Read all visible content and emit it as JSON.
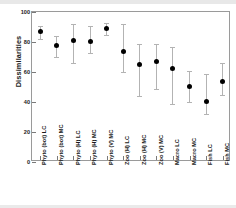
{
  "chart_data": {
    "type": "scatter",
    "title": "",
    "xlabel": "",
    "ylabel": "Dissimilarities",
    "ylim": [
      0,
      100
    ],
    "yticks": [
      0,
      20,
      40,
      60,
      80,
      100
    ],
    "ytick_labels": [
      "0",
      "20",
      "40",
      "60",
      "80",
      "100"
    ],
    "grid": false,
    "legend": "none",
    "error_bars": "vertical, capped",
    "marker_color": "#000000",
    "errorbar_color": "#b3b3b3",
    "categories": [
      "Phyto (bot) LC",
      "Phyto (bot) MC",
      "Phyto (H) LC",
      "Phyto (H) MC",
      "Phyto (V) MC",
      "Zoo (H) LC",
      "Zoo (H) MC",
      "Zoo (V) MC",
      "Macro LC",
      "Macro MC",
      "Fish LC",
      "Fish MC"
    ],
    "values": [
      87,
      78,
      81,
      80.5,
      89,
      74,
      65,
      67,
      62.5,
      50.5,
      40.5,
      54
    ],
    "lower": [
      82,
      70,
      66,
      73,
      85,
      60,
      44,
      49,
      38.5,
      40,
      32,
      44.5
    ],
    "upper": [
      91,
      84,
      92,
      91,
      93,
      92,
      79,
      79,
      77,
      61,
      59,
      66
    ],
    "points": [
      {
        "category": "Phyto (bot) LC",
        "value": 87,
        "lower": 82,
        "upper": 91
      },
      {
        "category": "Phyto (bot) MC",
        "value": 78,
        "lower": 70,
        "upper": 84
      },
      {
        "category": "Phyto (H) LC",
        "value": 81,
        "lower": 66,
        "upper": 92
      },
      {
        "category": "Phyto (H) MC",
        "value": 80.5,
        "lower": 73,
        "upper": 91
      },
      {
        "category": "Phyto (V) MC",
        "value": 89,
        "lower": 85,
        "upper": 93
      },
      {
        "category": "Zoo (H) LC",
        "value": 74,
        "lower": 60,
        "upper": 92
      },
      {
        "category": "Zoo (H) MC",
        "value": 65,
        "lower": 44,
        "upper": 79
      },
      {
        "category": "Zoo (V) MC",
        "value": 67,
        "lower": 49,
        "upper": 79
      },
      {
        "category": "Macro LC",
        "value": 62.5,
        "lower": 38.5,
        "upper": 77
      },
      {
        "category": "Macro MC",
        "value": 50.5,
        "lower": 40,
        "upper": 61
      },
      {
        "category": "Fish LC",
        "value": 40.5,
        "lower": 32,
        "upper": 59
      },
      {
        "category": "Fish MC",
        "value": 54,
        "lower": 44.5,
        "upper": 66
      }
    ]
  }
}
